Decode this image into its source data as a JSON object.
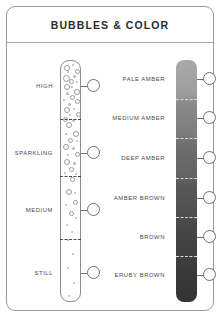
{
  "card": {
    "title": "BUBBLES & COLOR"
  },
  "bubbles": {
    "axis_name": "bubble-intensity-scale",
    "levels": [
      {
        "label": "HIGH",
        "y": 85,
        "density": "very-high"
      },
      {
        "label": "SPARKLING",
        "y": 152,
        "density": "high"
      },
      {
        "label": "MEDIUM",
        "y": 209,
        "density": "medium"
      },
      {
        "label": "STILL",
        "y": 272,
        "density": "low"
      }
    ],
    "divider_y": [
      118,
      175,
      238
    ]
  },
  "color": {
    "axis_name": "color-depth-scale",
    "levels": [
      {
        "label": "PALE AMBER",
        "y": 78,
        "swatch": "#a9a9a9"
      },
      {
        "label": "MEDIUM AMBER",
        "y": 117,
        "swatch": "#7c7c7c"
      },
      {
        "label": "DEEP AMBER",
        "y": 157,
        "swatch": "#636363"
      },
      {
        "label": "AMBER BROWN",
        "y": 197,
        "swatch": "#4e4e4e"
      },
      {
        "label": "BROWN",
        "y": 236,
        "swatch": "#3f3f3f"
      },
      {
        "label": "ERUBY BROWN",
        "y": 274,
        "swatch": "#333333"
      }
    ],
    "divider_y": [
      98,
      137,
      177,
      216,
      255
    ],
    "gradient_top": "#a9a9a9",
    "gradient_bottom": "#333333"
  },
  "style": {
    "border": "#9a9a9a",
    "text": "#4b4b4b",
    "title_color": "#2c2c2c"
  }
}
